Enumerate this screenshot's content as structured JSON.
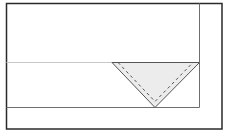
{
  "diagram": {
    "type": "sewing-pattern-fold",
    "colors": {
      "background": "#ffffff",
      "outer_border": "#2a2a2a",
      "inner_border": "#6e6e6e",
      "fold_line": "#c8c8c8",
      "triangle_fill": "#ececec",
      "triangle_edge": "#555555",
      "stitch_line": "#555555"
    },
    "shapes": {
      "outer_rect": {
        "x": 6,
        "y": 3,
        "w": 216,
        "h": 126
      },
      "inner_rect": {
        "x": 6,
        "y": 3,
        "w": 193,
        "h": 104
      },
      "fold_line_y": 62,
      "triangle": {
        "left": [
          112,
          62
        ],
        "right": [
          199,
          62
        ],
        "apex": [
          155,
          107
        ]
      },
      "stitch_offset": 4
    }
  }
}
